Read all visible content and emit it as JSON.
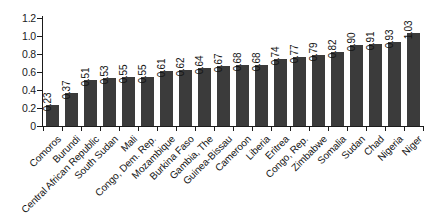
{
  "chart_data": {
    "type": "bar",
    "title": "",
    "subtitle": "",
    "xlabel": "",
    "ylabel": "",
    "ylim": [
      0,
      1.2
    ],
    "ytick_labels": [
      "0",
      "0.2",
      "0.4",
      "0.6",
      "0.8",
      "1.0",
      "1.2"
    ],
    "ytick_values": [
      0,
      0.2,
      0.4,
      0.6,
      0.8,
      1.0,
      1.2
    ],
    "grid": false,
    "legend": null,
    "legend_position": "none",
    "bar_color": "#3b3b3b",
    "axis_color": "#1b1b1b",
    "background_color": "#ffffff",
    "value_labels_rotated": true,
    "category_labels_rotated": true,
    "categories": [
      "Comoros",
      "Burundi",
      "Central African Republic",
      "South Sudan",
      "Mali",
      "Congo, Dem. Rep.",
      "Mozambique",
      "Burkina Faso",
      "Gambia, The",
      "Guinea-Bissau",
      "Cameroon",
      "Liberia",
      "Eritrea",
      "Congo, Rep.",
      "Zimbabwe",
      "Somalia",
      "Sudan",
      "Chad",
      "Nigeria",
      "Niger"
    ],
    "values": [
      0.23,
      0.37,
      0.51,
      0.53,
      0.55,
      0.55,
      0.61,
      0.62,
      0.64,
      0.67,
      0.68,
      0.68,
      0.74,
      0.77,
      0.79,
      0.82,
      0.9,
      0.91,
      0.93,
      1.03
    ],
    "value_labels": [
      "0.23",
      "0.37",
      "0.51",
      "0.53",
      "0.55",
      "0.55",
      "0.61",
      "0.62",
      "0.64",
      "0.67",
      "0.68",
      "0.68",
      "0.74",
      "0.77",
      "0.79",
      "0.82",
      "0.90",
      "0.91",
      "0.93",
      "1.03"
    ]
  }
}
